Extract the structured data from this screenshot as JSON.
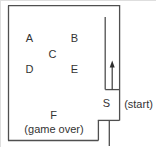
{
  "diagram": {
    "rooms": {
      "a": "A",
      "b": "B",
      "c": "C",
      "d": "D",
      "e": "E",
      "f": "F"
    },
    "start": {
      "label": "S",
      "annotation": "(start)"
    },
    "annotations": {
      "game_over": "(game over)"
    },
    "icons": {
      "up_arrow": "up-arrow-icon"
    },
    "colors": {
      "wall": "#4f4f4f",
      "text": "#333333",
      "background": "#ffffff"
    }
  }
}
